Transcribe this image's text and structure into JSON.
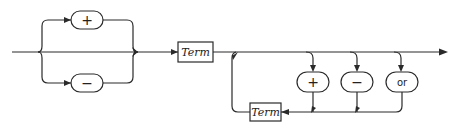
{
  "diagram": {
    "type": "syntax-diagram",
    "sign_options": [
      {
        "label": "+"
      },
      {
        "label": "−"
      }
    ],
    "first_term": {
      "label": "Term"
    },
    "loop_operators": [
      {
        "label": "+"
      },
      {
        "label": "−"
      },
      {
        "label": "or"
      }
    ],
    "loop_term": {
      "label": "Term"
    },
    "colors": {
      "stroke": "#2a2a2a",
      "background": "#ffffff"
    }
  }
}
